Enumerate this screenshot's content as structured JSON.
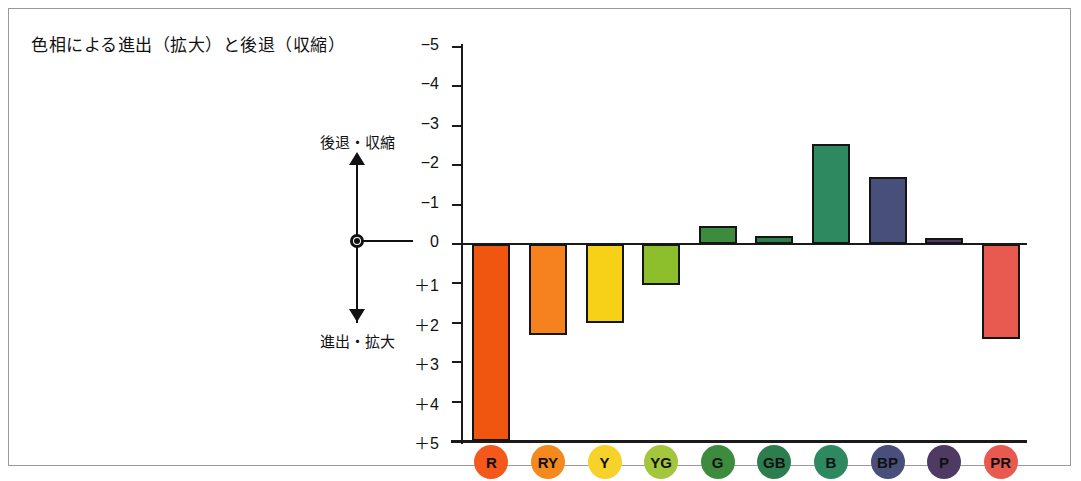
{
  "title": "色相による進出（拡大）と後退（収縮）",
  "annotation": {
    "top_label": "後退・収縮",
    "bottom_label": "進出・拡大",
    "arrow_icon": "double-headed-vertical-arrow",
    "origin_marker": "center-dot"
  },
  "chart_data": {
    "type": "bar",
    "title": "色相による進出（拡大）と後退（収縮）",
    "xlabel": "",
    "ylabel": "",
    "orientation": "vertical",
    "y_axis_inverted": true,
    "grid": false,
    "legend_position": "bottom",
    "ylim": [
      -5,
      5
    ],
    "yticks": [
      -5,
      -4,
      -3,
      -2,
      -1,
      0,
      1,
      2,
      3,
      4,
      5
    ],
    "ytick_labels": [
      "−5",
      "−4",
      "−3",
      "−2",
      "−1",
      "0",
      "＋1",
      "＋2",
      "＋3",
      "＋4",
      "＋5"
    ],
    "categories": [
      "R",
      "RY",
      "Y",
      "YG",
      "G",
      "GB",
      "B",
      "BP",
      "P",
      "PR"
    ],
    "values": [
      5.0,
      2.3,
      2.0,
      1.05,
      -0.45,
      -0.2,
      -2.55,
      -1.7,
      -0.15,
      2.4
    ],
    "colors": [
      "#F0560F",
      "#F5821F",
      "#F7D117",
      "#8DBE2B",
      "#3D8B3D",
      "#2E7D4F",
      "#2E8860",
      "#474F7A",
      "#4F3A63",
      "#E8594F"
    ],
    "legend_colors": [
      "#F4581A",
      "#F4891F",
      "#F6D22B",
      "#A3C63C",
      "#3D8B3D",
      "#2E7D4F",
      "#2E8860",
      "#474F7A",
      "#4F3A63",
      "#E8594F"
    ],
    "note_positive_direction": "進出・拡大",
    "note_negative_direction": "後退・収縮"
  }
}
